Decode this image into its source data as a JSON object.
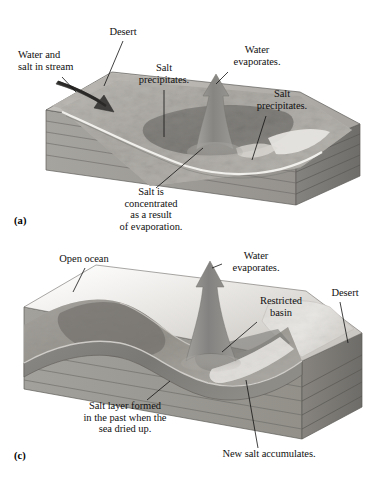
{
  "figure": {
    "type": "geologic-block-diagram",
    "background_color": "#ffffff",
    "text_color": "#111111"
  },
  "palette": {
    "block_top_light": "#d8d6d2",
    "block_top_mid": "#b9b6b1",
    "block_front": "#9e9c98",
    "block_front_dark": "#8a8884",
    "block_end": "#7f7d79",
    "strata_line": "#6f6d69",
    "water_dark": "#6e6c69",
    "water_mid": "#8d8b87",
    "salt_white": "#f2f1ee",
    "salt_pan": "#c9c6c1",
    "arrow_gray": "#8d8b88",
    "arrow_dark": "#3a3938",
    "outline": "#4a4846"
  },
  "panels": [
    {
      "key": "(a)",
      "key_position": {
        "x": 14,
        "y": 215
      },
      "caption_lines": [
        "Salt is",
        "concentrated",
        "as a result",
        "of evaporation."
      ],
      "labels": [
        {
          "name": "desert",
          "lines": [
            "Desert"
          ],
          "align": "center",
          "x": 93,
          "y": 26,
          "width": 60,
          "leader": {
            "x1": 123,
            "y1": 41,
            "x2": 104,
            "y2": 86
          }
        },
        {
          "name": "water-and-salt-in-stream",
          "lines": [
            "Water and",
            "salt in stream"
          ],
          "align": "left",
          "x": 18,
          "y": 49,
          "width": 80,
          "leader": {
            "x1": 62,
            "y1": 77,
            "x2": 76,
            "y2": 92
          }
        },
        {
          "name": "salt-precipitates-left",
          "lines": [
            "Salt",
            "precipitates."
          ],
          "align": "center",
          "x": 128,
          "y": 62,
          "width": 72,
          "leader": {
            "x1": 164,
            "y1": 90,
            "x2": 164,
            "y2": 137
          }
        },
        {
          "name": "water-evaporates",
          "lines": [
            "Water",
            "evaporates."
          ],
          "align": "center",
          "x": 219,
          "y": 44,
          "width": 76,
          "leader": {
            "x1": 228,
            "y1": 72,
            "x2": 216,
            "y2": 84
          }
        },
        {
          "name": "salt-precipitates-right",
          "lines": [
            "Salt",
            "precipitates."
          ],
          "align": "center",
          "x": 244,
          "y": 88,
          "width": 76,
          "leader": {
            "x1": 266,
            "y1": 116,
            "x2": 252,
            "y2": 160
          }
        },
        {
          "name": "salt-is-concentrated",
          "lines": [
            "Salt is",
            "concentrated",
            "as a result",
            "of evaporation."
          ],
          "align": "center",
          "x": 102,
          "y": 186,
          "width": 98,
          "leader": {
            "x1": 156,
            "y1": 188,
            "x2": 203,
            "y2": 148
          }
        }
      ]
    },
    {
      "key": "(c)",
      "key_position": {
        "x": 14,
        "y": 450
      },
      "caption_lines": [
        "Salt layer formed",
        "in the past when the",
        "sea dried up."
      ],
      "labels": [
        {
          "name": "open-ocean",
          "lines": [
            "Open ocean"
          ],
          "align": "center",
          "x": 46,
          "y": 253,
          "width": 76,
          "leader": {
            "x1": 85,
            "y1": 268,
            "x2": 73,
            "y2": 292
          }
        },
        {
          "name": "water-evaporates",
          "lines": [
            "Water",
            "evaporates."
          ],
          "align": "center",
          "x": 218,
          "y": 250,
          "width": 76,
          "leader": {
            "x1": 222,
            "y1": 264,
            "x2": 212,
            "y2": 268
          }
        },
        {
          "name": "restricted-basin",
          "lines": [
            "Restricted",
            "basin"
          ],
          "align": "center",
          "x": 245,
          "y": 295,
          "width": 72,
          "leader": {
            "x1": 257,
            "y1": 322,
            "x2": 222,
            "y2": 352
          }
        },
        {
          "name": "desert",
          "lines": [
            "Desert"
          ],
          "align": "center",
          "x": 318,
          "y": 287,
          "width": 54,
          "leader": {
            "x1": 340,
            "y1": 302,
            "x2": 348,
            "y2": 343
          }
        },
        {
          "name": "salt-layer-formed",
          "lines": [
            "Salt layer formed",
            "in the past when the",
            "sea dried up."
          ],
          "align": "center",
          "x": 62,
          "y": 400,
          "width": 126,
          "leader": {
            "x1": 147,
            "y1": 400,
            "x2": 170,
            "y2": 381
          }
        },
        {
          "name": "new-salt-accumulates",
          "lines": [
            "New salt accumulates."
          ],
          "align": "center",
          "x": 204,
          "y": 448,
          "width": 130,
          "leader": {
            "x1": 258,
            "y1": 448,
            "x2": 246,
            "y2": 380
          }
        }
      ]
    }
  ]
}
